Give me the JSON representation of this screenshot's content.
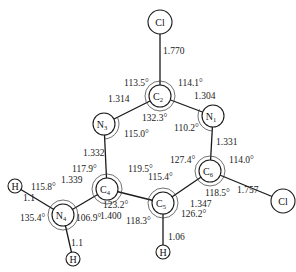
{
  "diagram": {
    "type": "molecular-structure",
    "atoms": [
      {
        "id": "Cl_top",
        "symbol": "Cl",
        "sub": "",
        "x": 160,
        "y": 22,
        "r": 12
      },
      {
        "id": "C2",
        "symbol": "C",
        "sub": "2",
        "x": 160,
        "y": 96,
        "r": 11
      },
      {
        "id": "N3",
        "symbol": "N",
        "sub": "3",
        "x": 104,
        "y": 124,
        "r": 11
      },
      {
        "id": "N1",
        "symbol": "N",
        "sub": "1",
        "x": 213,
        "y": 116,
        "r": 11
      },
      {
        "id": "C4",
        "symbol": "C",
        "sub": "4",
        "x": 107,
        "y": 189,
        "r": 11
      },
      {
        "id": "C6",
        "symbol": "C",
        "sub": "6",
        "x": 210,
        "y": 171,
        "r": 11
      },
      {
        "id": "C5",
        "symbol": "C",
        "sub": "5",
        "x": 163,
        "y": 203,
        "r": 11
      },
      {
        "id": "N4",
        "symbol": "N",
        "sub": "4",
        "x": 63,
        "y": 215,
        "r": 11
      },
      {
        "id": "H_N4_left",
        "symbol": "H",
        "sub": "",
        "x": 15,
        "y": 186,
        "r": 7
      },
      {
        "id": "H_N4_bottom",
        "symbol": "H",
        "sub": "",
        "x": 73,
        "y": 259,
        "r": 7
      },
      {
        "id": "H_C5",
        "symbol": "H",
        "sub": "",
        "x": 163,
        "y": 252,
        "r": 7
      },
      {
        "id": "Cl_right",
        "symbol": "Cl",
        "sub": "",
        "x": 283,
        "y": 201,
        "r": 12
      }
    ],
    "bonds": [
      {
        "a": "Cl_top",
        "b": "C2",
        "length": "1.770"
      },
      {
        "a": "C2",
        "b": "N3",
        "length": "1.314"
      },
      {
        "a": "C2",
        "b": "N1",
        "length": "1.304"
      },
      {
        "a": "N3",
        "b": "C4",
        "length": "1.332"
      },
      {
        "a": "N1",
        "b": "C6",
        "length": "1.331"
      },
      {
        "a": "C4",
        "b": "C5",
        "length": "1.400"
      },
      {
        "a": "C5",
        "b": "C6",
        "length": "1.347"
      },
      {
        "a": "C4",
        "b": "N4",
        "length": "1.339"
      },
      {
        "a": "C6",
        "b": "Cl_right",
        "length": "1.757"
      },
      {
        "a": "N4",
        "b": "H_N4_left",
        "length": "1.1"
      },
      {
        "a": "N4",
        "b": "H_N4_bottom",
        "length": "1.1"
      },
      {
        "a": "C5",
        "b": "H_C5",
        "length": "1.06"
      }
    ],
    "bond_labels": [
      {
        "text": "1.770",
        "x": 163,
        "y": 54
      },
      {
        "text": "1.314",
        "x": 108,
        "y": 102
      },
      {
        "text": "1.304",
        "x": 194,
        "y": 99
      },
      {
        "text": "1.332",
        "x": 83,
        "y": 156
      },
      {
        "text": "1.331",
        "x": 216,
        "y": 145
      },
      {
        "text": "1.339",
        "x": 61,
        "y": 183
      },
      {
        "text": "1.400",
        "x": 100,
        "y": 219
      },
      {
        "text": "1.347",
        "x": 190,
        "y": 207
      },
      {
        "text": "1.757",
        "x": 237,
        "y": 193
      },
      {
        "text": "1.1",
        "x": 23,
        "y": 201
      },
      {
        "text": "1.1",
        "x": 71,
        "y": 246
      },
      {
        "text": "1.06",
        "x": 168,
        "y": 240
      }
    ],
    "angle_labels": [
      {
        "text": "113.5°",
        "x": 124,
        "y": 86
      },
      {
        "text": "114.1°",
        "x": 178,
        "y": 86
      },
      {
        "text": "132.3°",
        "x": 142,
        "y": 121
      },
      {
        "text": "110.2°",
        "x": 174,
        "y": 131
      },
      {
        "text": "115.0°",
        "x": 124,
        "y": 137
      },
      {
        "text": "117.9°",
        "x": 72,
        "y": 172
      },
      {
        "text": "119.5°",
        "x": 128,
        "y": 172
      },
      {
        "text": "115.4°",
        "x": 148,
        "y": 180
      },
      {
        "text": "127.4°",
        "x": 170,
        "y": 163
      },
      {
        "text": "114.0°",
        "x": 229,
        "y": 163
      },
      {
        "text": "118.5°",
        "x": 205,
        "y": 196
      },
      {
        "text": "123.2°",
        "x": 103,
        "y": 208
      },
      {
        "text": "118.3°",
        "x": 126,
        "y": 224
      },
      {
        "text": "126.2°",
        "x": 181,
        "y": 217
      },
      {
        "text": "115.8°",
        "x": 31,
        "y": 190
      },
      {
        "text": "135.4°",
        "x": 20,
        "y": 221
      },
      {
        "text": "106.9°",
        "x": 76,
        "y": 221
      }
    ]
  }
}
